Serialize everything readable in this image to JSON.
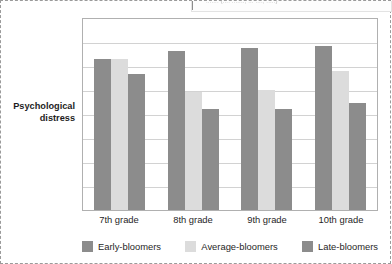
{
  "figure": {
    "top_fragment_text": "....... (.... ......., ... ...., .....)"
  },
  "chart_data": {
    "type": "bar",
    "title": "",
    "xlabel": "",
    "ylabel": "Psychological distress",
    "categories": [
      "7th grade",
      "8th grade",
      "9th grade",
      "10th grade"
    ],
    "series": [
      {
        "name": "Early-bloomers",
        "color": "#8c8c8c",
        "values": [
          79,
          83,
          85,
          86
        ]
      },
      {
        "name": "Average-bloomers",
        "color": "#dcdcdc",
        "values": [
          79,
          62,
          63,
          73
        ]
      },
      {
        "name": "Late-bloomers",
        "color": "#8c8c8c",
        "values": [
          71,
          53,
          53,
          56
        ]
      }
    ],
    "ylim": [
      0,
      100
    ],
    "y_ticks_visible": false,
    "gridlines": {
      "horizontal": true,
      "count": 7,
      "color": "#d2d2d2"
    },
    "legend_position": "bottom"
  },
  "legend": {
    "items": [
      {
        "label": "Early-bloomers",
        "color": "#8c8c8c"
      },
      {
        "label": "Average-bloomers",
        "color": "#dcdcdc"
      },
      {
        "label": "Late-bloomers",
        "color": "#8c8c8c"
      }
    ]
  }
}
